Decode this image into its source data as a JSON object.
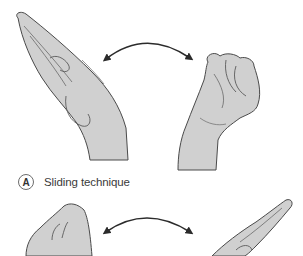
{
  "figure": {
    "panel_label": "A",
    "caption": "Sliding technique",
    "colors": {
      "skin_fill": "#d0d0d0",
      "outline": "#4a4a4a",
      "arrow": "#2b2b2b",
      "background": "#ffffff"
    },
    "top_row": {
      "left_hand": "open-flat-hand",
      "arrow": "double-headed-curved-arrow",
      "right_hand": "closed-fist"
    },
    "bottom_row": {
      "left_hand": "closed-fist",
      "arrow": "double-headed-curved-arrow",
      "right_hand": "open-flat-hand"
    }
  }
}
